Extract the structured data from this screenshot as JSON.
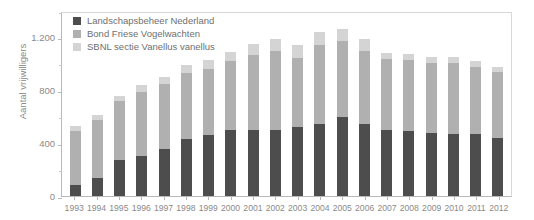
{
  "chart_data": {
    "type": "bar",
    "stacked": true,
    "title": "",
    "xlabel": "",
    "ylabel": "Aantal vrijwilligers",
    "ylim": [
      0,
      1400
    ],
    "ytick_values": [
      0,
      200,
      400,
      600,
      800,
      1000,
      1200,
      1400
    ],
    "ytick_labels": [
      "0",
      "",
      "400",
      "",
      "800",
      "",
      "1.200",
      ""
    ],
    "grid": false,
    "legend_position": "top-left",
    "categories": [
      "1993",
      "1994",
      "1995",
      "1996",
      "1997",
      "1998",
      "1999",
      "2000",
      "2001",
      "2002",
      "2003",
      "2004",
      "2005",
      "2006",
      "2007",
      "2008",
      "2009",
      "2010",
      "2011",
      "2012"
    ],
    "series": [
      {
        "name": "Landschapsbeheer Nederland",
        "color": "#4d4d4d",
        "values": [
          80,
          135,
          270,
          300,
          355,
          430,
          465,
          500,
          500,
          500,
          520,
          545,
          600,
          545,
          500,
          490,
          480,
          470,
          470,
          440
        ]
      },
      {
        "name": "Bond Friese Vogelwachten",
        "color": "#b0b0b0",
        "values": [
          415,
          440,
          450,
          490,
          490,
          500,
          500,
          520,
          570,
          595,
          525,
          600,
          570,
          555,
          540,
          540,
          530,
          540,
          510,
          500
        ]
      },
      {
        "name": "SBNL sectie Vanellus vanellus",
        "color": "#d4d4d4",
        "values": [
          35,
          35,
          40,
          50,
          55,
          60,
          65,
          70,
          80,
          90,
          95,
          95,
          95,
          85,
          45,
          45,
          45,
          45,
          45,
          35
        ]
      }
    ],
    "totals": [
      530,
      610,
      760,
      840,
      900,
      990,
      1030,
      1090,
      1150,
      1185,
      1140,
      1240,
      1265,
      1185,
      1085,
      1075,
      1055,
      1055,
      1025,
      975
    ]
  },
  "legend": {
    "items": [
      {
        "label": "Landschapsbeheer Nederland",
        "color": "#4d4d4d"
      },
      {
        "label": "Bond Friese Vogelwachten",
        "color": "#b0b0b0"
      },
      {
        "label": "SBNL sectie Vanellus vanellus",
        "color": "#d4d4d4"
      }
    ]
  },
  "axes": {
    "y_title": "Aantal vrijwilligers"
  }
}
